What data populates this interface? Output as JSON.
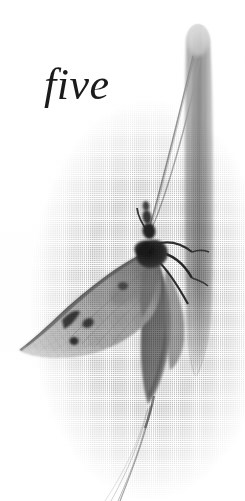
{
  "page": {
    "kind": "book-plate-page",
    "width": 245,
    "height": 501,
    "background_color": "#ffffff",
    "paper_color": "#fefefe",
    "print_style": "halftone-screened black-and-white photograph"
  },
  "chapter_heading": {
    "text": "five",
    "style": "italic calligraphic serif",
    "color": "#1b1b1b",
    "font_size_px": 44,
    "position": {
      "x": 44,
      "y": 52
    }
  },
  "photograph": {
    "subject": "moth resting on a blade of grass",
    "tones": {
      "lightest": "#f2f2f2",
      "light_gray": "#d2d2d2",
      "mid_gray": "#9a9a9a",
      "dark_gray": "#6a6a6a",
      "darkest": "#2b2b2b"
    },
    "elements": [
      {
        "name": "grass-blade",
        "description": "vertical blade of grass, rounded tip at top, tapering lower end",
        "top_y": 22,
        "bottom_y": 378,
        "left_x": 184,
        "right_x": 214,
        "fill": "#9e9e9e"
      },
      {
        "name": "moth-forewing",
        "description": "mottled gray forewing angled down-left with dark leading edge and dark spots",
        "tip": {
          "x": 18,
          "y": 348
        },
        "base": {
          "x": 150,
          "y": 256
        },
        "fill": "#b4b4b4",
        "edge": "#5a5a5a"
      },
      {
        "name": "moth-hindwing",
        "description": "dark elongated hindwing hanging downward alongside the blade",
        "top": {
          "x": 160,
          "y": 268
        },
        "bottom": {
          "x": 150,
          "y": 404
        },
        "fill": "#6d6d6d"
      },
      {
        "name": "moth-thorax",
        "description": "dark furry thorax gripping the blade",
        "center": {
          "x": 152,
          "y": 254
        },
        "fill": "#262626"
      },
      {
        "name": "moth-head",
        "description": "small dark head above thorax",
        "center": {
          "x": 150,
          "y": 228
        },
        "fill": "#2b2b2b"
      },
      {
        "name": "moth-antennae",
        "description": "two long thin antennae arcing up and right to the top of the blade",
        "count": 2,
        "color": "#7a7a7a"
      },
      {
        "name": "moth-legs",
        "description": "three dark legs reaching right to clasp the grass blade",
        "count": 3,
        "color": "#3a3a3a"
      },
      {
        "name": "moth-tail-filaments",
        "description": "fine hair-like filaments fanning down-left below the wings",
        "count": 4,
        "color": "#8f8f8f"
      }
    ]
  }
}
